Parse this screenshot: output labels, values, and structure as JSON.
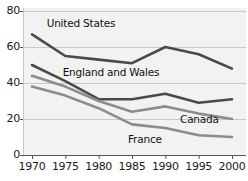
{
  "chart_data": {
    "type": "line",
    "title": "",
    "xlabel": "",
    "ylabel": "",
    "x": [
      1970,
      1975,
      1980,
      1985,
      1990,
      1995,
      2000
    ],
    "xtick_labels": [
      "1970",
      "1975",
      "1980",
      "1985",
      "1990",
      "1995",
      "2000"
    ],
    "ytick_labels": [
      "0",
      "20",
      "40",
      "60",
      "80"
    ],
    "yticks": [
      0,
      20,
      40,
      60,
      80
    ],
    "ylim": [
      0,
      80
    ],
    "xlim": [
      1970,
      2000
    ],
    "grid": "horizontal",
    "legend_position": "inline-annotations",
    "series": [
      {
        "name": "United States",
        "color": "#4a4a4a",
        "values": [
          67,
          55,
          53,
          51,
          60,
          56,
          48
        ]
      },
      {
        "name": "England and Wales",
        "color": "#4a4a4a",
        "values": [
          50,
          41,
          31,
          31,
          34,
          29,
          31
        ]
      },
      {
        "name": "Canada",
        "color": "#8c8c8c",
        "values": [
          44,
          38,
          30,
          24,
          27,
          23,
          20
        ]
      },
      {
        "name": "France",
        "color": "#8c8c8c",
        "values": [
          38,
          33,
          26,
          17,
          15,
          11,
          10
        ]
      }
    ],
    "annotations": [
      {
        "text": "United States",
        "x": 1972.2,
        "y": 73
      },
      {
        "text": "England and Wales",
        "x": 1974.6,
        "y": 45.5
      },
      {
        "text": "Canada",
        "x": 1992.2,
        "y": 19.5
      },
      {
        "text": "France",
        "x": 1984.4,
        "y": 8.5
      }
    ],
    "colors": {
      "dark_line": "#4a4a4a",
      "light_line": "#8c8c8c",
      "grid": "#c8c8c8",
      "axis": "#555555",
      "plot_background": "#f2f2f2",
      "page_background": "#ffffff",
      "text": "#1a1a1a"
    }
  }
}
